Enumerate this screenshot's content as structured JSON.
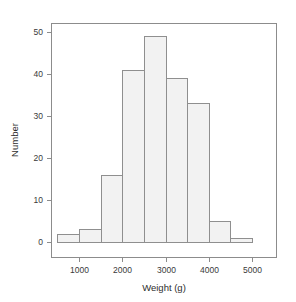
{
  "chart_data": {
    "type": "bar",
    "chart_subtype": "histogram",
    "title": "",
    "xlabel": "Weight (g)",
    "ylabel": "Number",
    "xlim": [
      400,
      5400
    ],
    "ylim": [
      0,
      52
    ],
    "grid": false,
    "legend": null,
    "bin_width": 500,
    "bin_edges": [
      500,
      1000,
      1500,
      2000,
      2500,
      3000,
      3500,
      4000,
      4500,
      5000
    ],
    "categories": [
      "500-1000",
      "1000-1500",
      "1500-2000",
      "2000-2500",
      "2500-3000",
      "3000-3500",
      "3500-4000",
      "4000-4500",
      "4500-5000"
    ],
    "values": [
      2,
      3,
      16,
      41,
      49,
      39,
      33,
      5,
      1
    ],
    "xticks": [
      1000,
      2000,
      3000,
      4000,
      5000
    ],
    "xtick_labels": [
      "1000",
      "2000",
      "3000",
      "4000",
      "5000"
    ],
    "yticks": [
      0,
      10,
      20,
      30,
      40,
      50
    ],
    "ytick_labels": [
      "0",
      "10",
      "20",
      "30",
      "40",
      "50"
    ],
    "bar_fill_color": "#f2f2f2",
    "bar_border_color": "#8f8f8f",
    "axis_color": "#8c8c8c",
    "text_color": "#3a3a3a",
    "background_color": "#ffffff"
  },
  "axes": {
    "x_title": "Weight (g)",
    "y_title": "Number"
  },
  "xtick_labels": {
    "t0": "1000",
    "t1": "2000",
    "t2": "3000",
    "t3": "4000",
    "t4": "5000"
  },
  "ytick_labels": {
    "t0": "0",
    "t1": "10",
    "t2": "20",
    "t3": "30",
    "t4": "40",
    "t5": "50"
  }
}
